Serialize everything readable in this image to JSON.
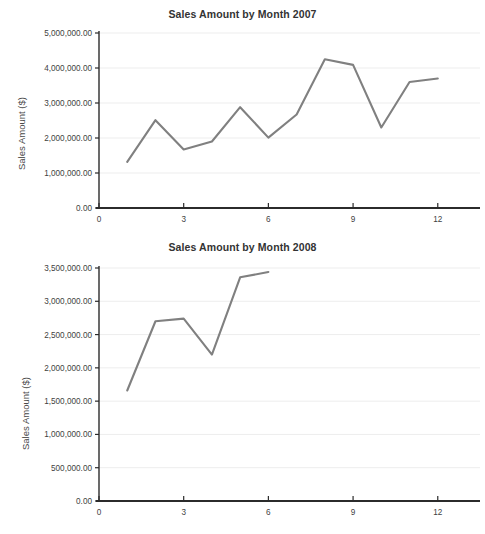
{
  "page": {
    "background": "#ffffff",
    "line_color": "#808080",
    "axis_color": "#2b2b2b",
    "grid_color": "#ededed"
  },
  "charts": [
    {
      "id": "chart-2007",
      "title": "Sales Amount by Month 2007",
      "ylabel": "Sales Amount ($)",
      "xlabel": "",
      "ytick_labels": [
        "0.00",
        "1,000,000.00",
        "2,000,000.00",
        "3,000,000.00",
        "4,000,000.00",
        "5,000,000.00"
      ],
      "xtick_labels": [
        "0",
        "3",
        "6",
        "9",
        "12"
      ]
    },
    {
      "id": "chart-2008",
      "title": "Sales Amount by Month 2008",
      "ylabel": "Sales Amount ($)",
      "xlabel": "",
      "ytick_labels": [
        "0.00",
        "500,000.00",
        "1,000,000.00",
        "1,500,000.00",
        "2,000,000.00",
        "2,500,000.00",
        "3,000,000.00",
        "3,500,000.00"
      ],
      "xtick_labels": [
        "0",
        "3",
        "6",
        "9",
        "12"
      ]
    }
  ],
  "chart_data": [
    {
      "type": "line",
      "title": "Sales Amount by Month 2007",
      "xlabel": "",
      "ylabel": "Sales Amount ($)",
      "x": [
        1,
        2,
        3,
        4,
        5,
        6,
        7,
        8,
        9,
        10,
        11,
        12
      ],
      "values": [
        1320000,
        2510000,
        1670000,
        1900000,
        2880000,
        2010000,
        2670000,
        4250000,
        4090000,
        2300000,
        3600000,
        3700000
      ],
      "xlim": [
        0,
        13
      ],
      "ylim": [
        0,
        5000000
      ],
      "yticks": [
        0,
        1000000,
        2000000,
        3000000,
        4000000,
        5000000
      ],
      "ytick_labels": [
        "0.00",
        "1,000,000.00",
        "2,000,000.00",
        "3,000,000.00",
        "4,000,000.00",
        "5,000,000.00"
      ],
      "xticks": [
        0,
        3,
        6,
        9,
        12
      ],
      "xtick_labels": [
        "0",
        "3",
        "6",
        "9",
        "12"
      ],
      "grid": true,
      "legend": false,
      "series_color": "#808080"
    },
    {
      "type": "line",
      "title": "Sales Amount by Month 2008",
      "xlabel": "",
      "ylabel": "Sales Amount ($)",
      "x": [
        1,
        2,
        3,
        4,
        5,
        6
      ],
      "values": [
        1660000,
        2700000,
        2740000,
        2200000,
        3360000,
        3440000
      ],
      "xlim": [
        0,
        13
      ],
      "ylim": [
        0,
        3500000
      ],
      "yticks": [
        0,
        500000,
        1000000,
        1500000,
        2000000,
        2500000,
        3000000,
        3500000
      ],
      "ytick_labels": [
        "0.00",
        "500,000.00",
        "1,000,000.00",
        "1,500,000.00",
        "2,000,000.00",
        "2,500,000.00",
        "3,000,000.00",
        "3,500,000.00"
      ],
      "xticks": [
        0,
        3,
        6,
        9,
        12
      ],
      "xtick_labels": [
        "0",
        "3",
        "6",
        "9",
        "12"
      ],
      "grid": true,
      "legend": false,
      "series_color": "#808080"
    }
  ]
}
